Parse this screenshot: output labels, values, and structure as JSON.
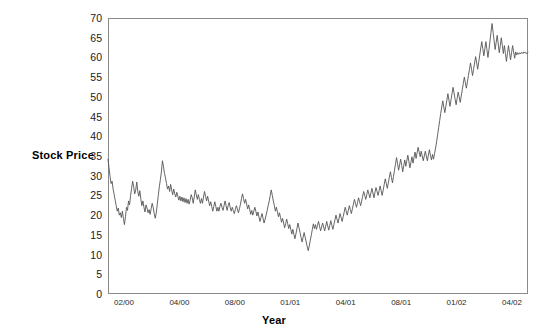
{
  "chart_data": {
    "type": "line",
    "title": "",
    "xlabel": "Year",
    "ylabel": "Stock Price",
    "ylim": [
      0,
      70
    ],
    "yticks": [
      0,
      5,
      10,
      15,
      20,
      25,
      30,
      35,
      40,
      45,
      50,
      55,
      60,
      65,
      70
    ],
    "xtick_labels": [
      "02/00",
      "04/00",
      "08/00",
      "01/01",
      "04/01",
      "08/01",
      "01/02",
      "04/02"
    ],
    "grid": false,
    "legend": false,
    "line_color": "#555555",
    "frame_color": "#8a8a8a",
    "series": [
      {
        "name": "Stock Price",
        "values": [
          34.2,
          32.0,
          29.8,
          28.0,
          28.6,
          26.6,
          25.2,
          23.8,
          22.4,
          21.0,
          21.8,
          20.0,
          20.6,
          19.4,
          21.0,
          19.2,
          17.6,
          19.6,
          22.0,
          21.2,
          23.6,
          22.6,
          25.0,
          26.8,
          28.6,
          27.2,
          25.4,
          26.4,
          28.4,
          26.0,
          24.8,
          26.2,
          24.0,
          22.4,
          23.6,
          22.0,
          20.8,
          22.6,
          21.8,
          20.6,
          21.4,
          20.2,
          21.6,
          23.0,
          22.0,
          20.4,
          19.2,
          20.6,
          22.8,
          25.0,
          27.2,
          29.0,
          31.0,
          33.8,
          32.4,
          30.6,
          29.4,
          28.0,
          26.6,
          27.4,
          26.0,
          27.8,
          26.4,
          25.2,
          26.6,
          25.4,
          24.6,
          25.8,
          24.8,
          23.8,
          24.8,
          23.6,
          24.6,
          23.4,
          24.4,
          23.2,
          24.2,
          23.0,
          24.0,
          22.8,
          23.8,
          25.2,
          24.4,
          23.0,
          24.6,
          26.4,
          25.2,
          24.0,
          25.2,
          24.0,
          23.0,
          24.2,
          23.0,
          24.6,
          26.0,
          24.8,
          23.6,
          24.8,
          23.6,
          22.4,
          23.4,
          22.2,
          21.0,
          22.2,
          23.4,
          22.2,
          21.0,
          22.0,
          21.0,
          22.2,
          23.0,
          22.0,
          21.2,
          22.4,
          23.6,
          22.4,
          21.2,
          22.4,
          23.2,
          22.0,
          21.0,
          22.0,
          21.2,
          20.4,
          21.4,
          22.4,
          21.6,
          20.6,
          21.6,
          22.8,
          24.2,
          25.4,
          24.2,
          23.0,
          24.0,
          22.8,
          21.6,
          22.6,
          21.4,
          20.2,
          21.2,
          20.0,
          21.0,
          22.0,
          21.0,
          19.8,
          20.8,
          19.6,
          18.4,
          19.4,
          20.4,
          19.2,
          18.0,
          19.0,
          20.0,
          21.2,
          22.4,
          23.6,
          25.0,
          26.4,
          25.0,
          23.6,
          22.4,
          21.0,
          22.0,
          20.8,
          19.6,
          20.6,
          19.4,
          18.2,
          19.2,
          18.0,
          16.8,
          17.8,
          19.0,
          17.8,
          16.6,
          17.6,
          16.4,
          15.2,
          16.4,
          15.2,
          14.0,
          15.2,
          16.6,
          18.0,
          16.8,
          15.6,
          14.4,
          13.2,
          14.4,
          15.6,
          14.4,
          13.2,
          12.0,
          11.0,
          12.2,
          13.6,
          15.0,
          16.4,
          17.8,
          16.6,
          17.6,
          16.4,
          17.4,
          18.4,
          17.2,
          16.0,
          17.0,
          18.0,
          17.0,
          16.0,
          17.2,
          18.4,
          17.2,
          16.2,
          17.4,
          18.6,
          17.4,
          16.4,
          17.6,
          18.8,
          20.0,
          19.0,
          18.0,
          19.2,
          20.4,
          19.4,
          18.4,
          19.6,
          20.8,
          22.0,
          21.0,
          20.0,
          21.2,
          22.4,
          21.4,
          20.4,
          21.6,
          22.8,
          24.0,
          23.0,
          22.0,
          23.2,
          24.4,
          23.4,
          22.4,
          23.6,
          24.8,
          26.0,
          25.0,
          24.0,
          25.2,
          26.4,
          25.4,
          24.4,
          25.6,
          26.8,
          25.6,
          24.4,
          25.8,
          27.0,
          26.0,
          25.0,
          26.2,
          27.4,
          26.2,
          25.0,
          26.4,
          27.8,
          29.2,
          28.0,
          26.8,
          28.2,
          29.6,
          31.0,
          29.6,
          28.2,
          29.8,
          31.4,
          33.0,
          34.6,
          33.0,
          31.4,
          32.8,
          34.2,
          32.6,
          31.0,
          32.6,
          34.0,
          32.4,
          33.8,
          35.2,
          33.6,
          32.0,
          33.4,
          34.8,
          33.2,
          34.6,
          36.0,
          34.4,
          35.8,
          37.2,
          36.0,
          34.8,
          36.2,
          35.0,
          33.8,
          35.0,
          36.2,
          35.0,
          33.8,
          35.2,
          36.6,
          35.2,
          34.0,
          35.4,
          34.2,
          35.6,
          37.0,
          38.6,
          40.4,
          42.2,
          44.0,
          45.8,
          47.4,
          49.0,
          47.4,
          46.0,
          47.6,
          49.2,
          50.8,
          49.2,
          47.6,
          49.2,
          50.8,
          52.4,
          51.0,
          49.4,
          48.0,
          49.6,
          51.2,
          50.0,
          48.6,
          50.2,
          51.8,
          53.4,
          55.0,
          53.6,
          52.2,
          53.8,
          55.4,
          57.0,
          58.6,
          57.0,
          55.4,
          57.0,
          58.6,
          60.2,
          58.6,
          57.0,
          58.8,
          60.6,
          62.4,
          64.0,
          62.2,
          60.4,
          62.2,
          64.0,
          62.0,
          60.0,
          62.0,
          64.2,
          66.4,
          68.6,
          66.4,
          64.2,
          62.0,
          63.8,
          65.6,
          63.4,
          61.2,
          63.0,
          65.0,
          63.0,
          61.0,
          63.0,
          61.0,
          59.0,
          61.0,
          63.0,
          61.2,
          59.4,
          61.2,
          63.0,
          61.4,
          59.8,
          61.4,
          60.6,
          61.2,
          60.8,
          61.2,
          60.9,
          61.3,
          61.0,
          61.4,
          61.1,
          61.2,
          61.0,
          61.2
        ]
      }
    ]
  }
}
